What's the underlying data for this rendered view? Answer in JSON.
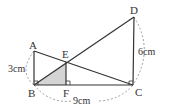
{
  "diagram": {
    "type": "geometry",
    "points": {
      "A": {
        "label": "A"
      },
      "B": {
        "label": "B"
      },
      "C": {
        "label": "C"
      },
      "D": {
        "label": "D"
      },
      "E": {
        "label": "E"
      },
      "F": {
        "label": "F"
      }
    },
    "dimensions": {
      "AB": "3cm",
      "DC": "6cm",
      "BC": "9cm"
    },
    "colors": {
      "line": "#333333",
      "shade": "#d4d4d4",
      "dashed": "#888888"
    }
  }
}
